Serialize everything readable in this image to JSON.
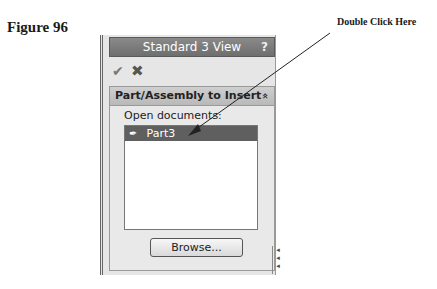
{
  "figure": {
    "label": "Figure 96"
  },
  "callout": {
    "text": "Double Click Here"
  },
  "panel": {
    "title": "Standard 3 View",
    "help_icon": "?",
    "ok_icon": "✔",
    "cancel_icon": "✖",
    "section": {
      "header": "Part/Assembly to Insert",
      "collapse_icon": "«",
      "open_label": "Open documents:",
      "items": [
        {
          "label": "Part3",
          "icon": "✒",
          "selected": true
        }
      ],
      "browse_label": "Browse..."
    },
    "grip": "◂◂◂"
  }
}
